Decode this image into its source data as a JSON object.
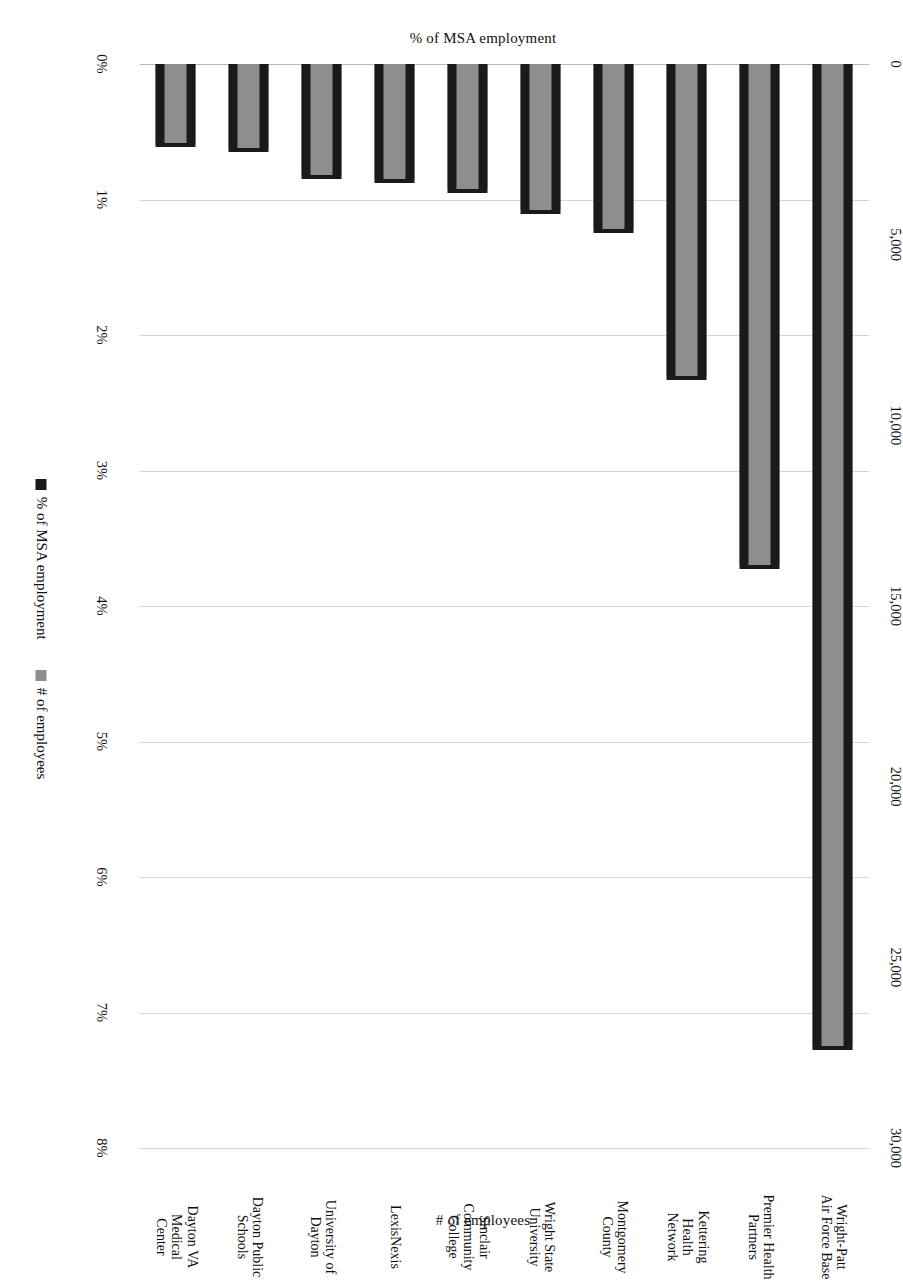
{
  "chart_data": {
    "type": "bar",
    "title": "",
    "orientation": "vertical-bars-rendered-sideways",
    "page_rotation_deg": 90,
    "categories": [
      "Wright-Patt\nAir Force Base",
      "Premier Health\nPartners",
      "Kettering\nHealth\nNetwork",
      "Montgomery\nCounty",
      "Wright State\nUniversity",
      "Sinclair\nCommunity\nCollege",
      "LexisNexis",
      "University of\nDayton",
      "Dayton Public\nSchools",
      "Dayton VA\nMedical\nCenter"
    ],
    "series": [
      {
        "name": "% of MSA employment",
        "color": "#1a1a1a",
        "axis": "left",
        "unit": "%",
        "values": [
          7.25,
          3.7,
          2.3,
          1.22,
          1.08,
          0.92,
          0.85,
          0.82,
          0.62,
          0.58
        ]
      },
      {
        "name": "# of employees",
        "color": "#8e8e8e",
        "axis": "right",
        "unit": "employees",
        "values": [
          27200,
          13900,
          8600,
          4600,
          4050,
          3450,
          3200,
          3080,
          2320,
          2170
        ]
      }
    ],
    "left_axis": {
      "label": "% of MSA employment",
      "ticks": [
        "0%",
        "1%",
        "2%",
        "3%",
        "4%",
        "5%",
        "6%",
        "7%",
        "8%"
      ],
      "min": 0,
      "max": 8,
      "step": 1
    },
    "right_axis": {
      "label": "# of employees",
      "ticks": [
        "0",
        "5,000",
        "10,000",
        "15,000",
        "20,000",
        "25,000",
        "30,000"
      ],
      "min": 0,
      "max": 30000,
      "step": 5000
    },
    "legend": {
      "position": "bottom",
      "entries": [
        {
          "label": "% of MSA employment",
          "color": "#1a1a1a"
        },
        {
          "label": "# of employees",
          "color": "#8e8e8e"
        }
      ]
    },
    "grid": true,
    "xlabel": "",
    "ylabel": "% of MSA employment"
  }
}
